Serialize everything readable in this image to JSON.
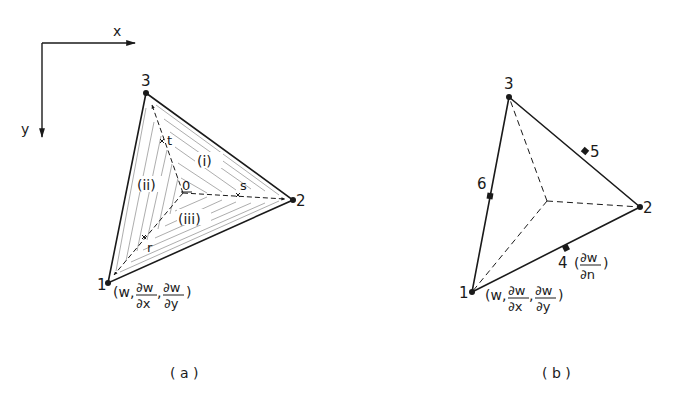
{
  "axes": {
    "x_label": "x",
    "y_label": "y"
  },
  "figure_a": {
    "caption": "( a )",
    "node_labels": {
      "n1": "1",
      "n2": "2",
      "n3": "3"
    },
    "centroid_label": "0",
    "local_axes": {
      "r": "r",
      "s": "s",
      "t": "t"
    },
    "subregions": {
      "i": "(i)",
      "ii": "(ii)",
      "iii": "(iii)"
    },
    "node1_dof": {
      "open": "(w,",
      "dw1_num": "∂w",
      "dw1_den": "∂x",
      "sep": ",",
      "dw2_num": "∂w",
      "dw2_den": "∂y",
      "close": ")"
    }
  },
  "figure_b": {
    "caption": "( b )",
    "node_labels": {
      "n1": "1",
      "n2": "2",
      "n3": "3",
      "n4": "4",
      "n5": "5",
      "n6": "6"
    },
    "node1_dof": {
      "open": "(w,",
      "dw1_num": "∂w",
      "dw1_den": "∂x",
      "sep": ",",
      "dw2_num": "∂w",
      "dw2_den": "∂y",
      "close": ")"
    },
    "node4_dof": {
      "open": "(",
      "num": "∂w",
      "den": "∂n",
      "close": ")"
    }
  },
  "colors": {
    "ink": "#1a1a1a",
    "hatch": "#8a8a8a",
    "background": "#ffffff"
  }
}
